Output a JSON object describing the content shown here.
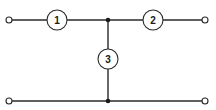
{
  "diagram": {
    "type": "two-port T network",
    "elements": [
      {
        "id": "element-1",
        "label": "1",
        "cx": 57,
        "cy": 20,
        "r": 10
      },
      {
        "id": "element-2",
        "label": "2",
        "cx": 153,
        "cy": 20,
        "r": 10
      },
      {
        "id": "element-3",
        "label": "3",
        "cx": 108,
        "cy": 59,
        "r": 10
      }
    ],
    "terminals": [
      {
        "id": "terminal-top-left",
        "x": 9,
        "y": 20
      },
      {
        "id": "terminal-top-right",
        "x": 205,
        "y": 20
      },
      {
        "id": "terminal-bottom-left",
        "x": 9,
        "y": 101
      },
      {
        "id": "terminal-bottom-right",
        "x": 205,
        "y": 101
      }
    ],
    "junctions": [
      {
        "id": "junction-top",
        "x": 108,
        "y": 20
      },
      {
        "id": "junction-bottom",
        "x": 108,
        "y": 101
      }
    ],
    "colors": {
      "line": "#2a2a2a",
      "background": "#ffffff"
    }
  }
}
